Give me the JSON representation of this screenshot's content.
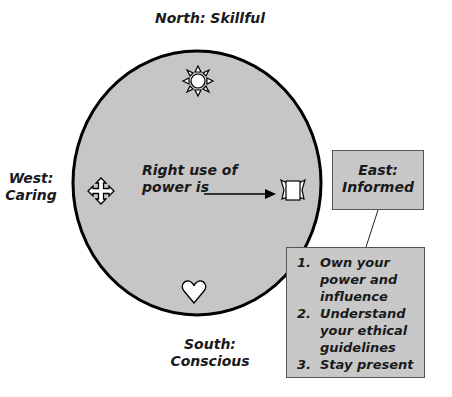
{
  "diagram": {
    "north": {
      "label": "North: Skillful",
      "icon": "sun-icon"
    },
    "west": {
      "label_line1": "West:",
      "label_line2": "Caring",
      "icon": "four-arrows-cross-icon"
    },
    "south": {
      "label_line1": "South:",
      "label_line2": "Conscious",
      "icon": "heart-icon"
    },
    "east": {
      "label_line1": "East:",
      "label_line2": "Informed",
      "icon": "scroll-icon"
    },
    "center": {
      "line1": "Right use of",
      "line2": "power is"
    },
    "list": [
      {
        "num": "1.",
        "text": "Own your power and influence"
      },
      {
        "num": "2.",
        "text": "Understand your ethical guidelines"
      },
      {
        "num": "3.",
        "text": "Stay present"
      }
    ],
    "colors": {
      "ellipse_fill": "#c6c6c6",
      "ellipse_stroke": "#000000",
      "box_fill": "#c8c8c8",
      "text": "#1a1a1a"
    }
  }
}
